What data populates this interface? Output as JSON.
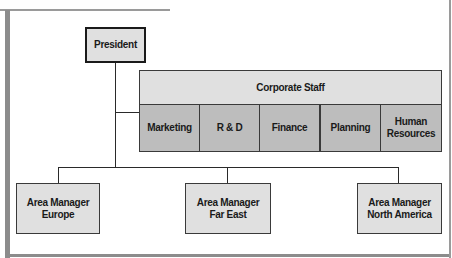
{
  "diagram": {
    "type": "organization-chart",
    "president": {
      "label": "President"
    },
    "corporate_staff": {
      "label": "Corporate Staff",
      "departments": [
        {
          "label": "Marketing"
        },
        {
          "label": "R & D"
        },
        {
          "label": "Finance"
        },
        {
          "label": "Planning"
        },
        {
          "label": "Human\nResources"
        }
      ]
    },
    "area_managers": [
      {
        "label": "Area Manager\nEurope"
      },
      {
        "label": "Area Manager\nFar East"
      },
      {
        "label": "Area Manager\nNorth America"
      }
    ]
  },
  "colors": {
    "box_light": "#e0e0e0",
    "box_dark": "#bdbdbd",
    "line": "#2a2a2a",
    "frame": "#8c8c8c"
  }
}
